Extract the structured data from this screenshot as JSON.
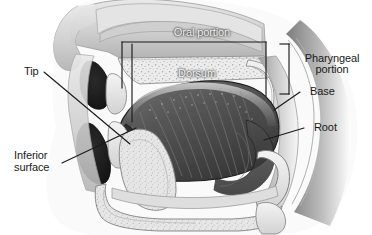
{
  "figure": {
    "type": "anatomical-illustration",
    "background_color": "#ffffff",
    "ink_color": "#1a1a1a",
    "light_text_color": "#f2f2f2",
    "width": 372,
    "height": 235
  },
  "labels": {
    "oral_portion": "Oral portion",
    "dorsum": "Dorsum",
    "pharyngeal_portion_line1": "Pharyngeal",
    "pharyngeal_portion_line2": "portion",
    "base": "Base",
    "root": "Root",
    "tip": "Tip",
    "inferior_surface_line1": "Inferior",
    "inferior_surface_line2": "surface"
  },
  "structures": {
    "hard_palate": "hard-palate",
    "soft_palate": "soft-palate",
    "upper_lip": "upper-lip",
    "lower_lip": "lower-lip",
    "upper_teeth": "upper-teeth",
    "lower_teeth": "lower-teeth",
    "tongue_body": "tongue-body",
    "mandible": "mandible",
    "epiglottis": "epiglottis",
    "pharynx_wall": "pharynx-wall",
    "nasal_cavity": "nasal-cavity",
    "sublingual_region": "sublingual-region",
    "hyoid": "hyoid-bone"
  },
  "annotation_colors": {
    "leader_line": "#1a1a1a",
    "bracket": "#1a1a1a"
  }
}
